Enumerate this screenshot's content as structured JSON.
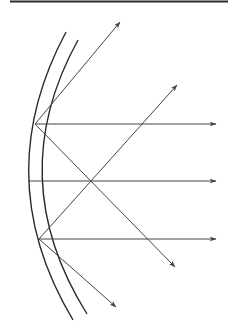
{
  "diagram": {
    "title": "",
    "stroke_color": "#2a2a2a",
    "ray_color": "#444444",
    "background": "#ffffff",
    "top_rule": {
      "x1": 10,
      "y1": 1.5,
      "x2": 228,
      "y2": 1.5
    },
    "mirror": {
      "outer_arc": {
        "start": [
          66,
          32
        ],
        "control": [
          -12,
          178
        ],
        "end": [
          73,
          320
        ]
      },
      "inner_arc": {
        "start": [
          78,
          40
        ],
        "control": [
          2,
          178
        ],
        "end": [
          87,
          314
        ]
      }
    },
    "focal_points": {
      "upper": [
        35,
        124
      ],
      "middle": [
        28,
        181
      ],
      "lower": [
        39,
        239
      ],
      "crossing": [
        90,
        181
      ]
    },
    "rays": [
      {
        "name": "upper-to-top",
        "from": [
          35,
          124
        ],
        "to": [
          120,
          22
        ]
      },
      {
        "name": "upper-horizontal",
        "from": [
          35,
          124
        ],
        "to": [
          216,
          124
        ]
      },
      {
        "name": "upper-diagonal-down",
        "from": [
          35,
          124
        ],
        "to": [
          175,
          267
        ]
      },
      {
        "name": "middle-horizontal",
        "from": [
          28,
          181
        ],
        "to": [
          216,
          181
        ]
      },
      {
        "name": "lower-diagonal-up",
        "from": [
          39,
          239
        ],
        "to": [
          177,
          85
        ]
      },
      {
        "name": "lower-horizontal",
        "from": [
          39,
          239
        ],
        "to": [
          216,
          239
        ]
      },
      {
        "name": "lower-to-bottom",
        "from": [
          39,
          239
        ],
        "to": [
          116,
          307
        ]
      }
    ]
  }
}
